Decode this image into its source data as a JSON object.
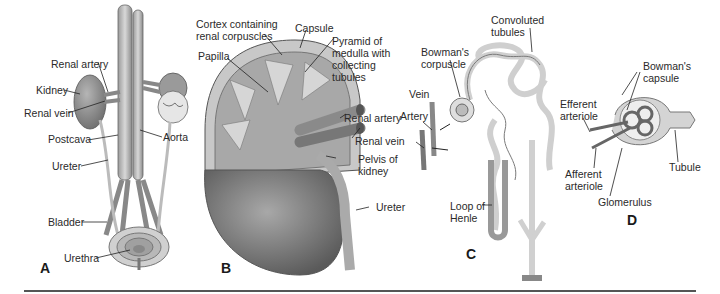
{
  "figure": {
    "panels": [
      {
        "letter": "A",
        "subject": "urinary system overview",
        "labels": [
          "Renal artery",
          "Kidney",
          "Renal vein",
          "Postcava",
          "Aorta",
          "Ureter",
          "Bladder",
          "Urethra"
        ]
      },
      {
        "letter": "B",
        "subject": "kidney section",
        "labels": [
          "Cortex containing",
          "renal corpuscles",
          "Capsule",
          "Pyramid of",
          "medulla with",
          "collecting",
          "tubules",
          "Papilla",
          "Renal artery",
          "Renal vein",
          "Pelvis of",
          "kidney",
          "Ureter"
        ]
      },
      {
        "letter": "C",
        "subject": "nephron",
        "labels": [
          "Convoluted",
          "tubules",
          "Bowman's",
          "corpuscle",
          "Vein",
          "Artery",
          "Loop of",
          "Henle"
        ]
      },
      {
        "letter": "D",
        "subject": "renal corpuscle",
        "labels": [
          "Bowman's",
          "capsule",
          "Efferent",
          "arteriole",
          "Afferent",
          "arteriole",
          "Glomerulus",
          "Tubule"
        ]
      }
    ]
  },
  "A": {
    "letter": "A",
    "renal_artery": "Renal artery",
    "kidney": "Kidney",
    "renal_vein": "Renal vein",
    "postcava": "Postcava",
    "aorta": "Aorta",
    "ureter": "Ureter",
    "bladder": "Bladder",
    "urethra": "Urethra"
  },
  "B": {
    "letter": "B",
    "cortex_1": "Cortex containing",
    "cortex_2": "renal corpuscles",
    "capsule": "Capsule",
    "pyramid_1": "Pyramid of",
    "pyramid_2": "medulla with",
    "pyramid_3": "collecting",
    "pyramid_4": "tubules",
    "papilla": "Papilla",
    "renal_artery": "Renal artery",
    "renal_vein": "Renal vein",
    "pelvis_1": "Pelvis of",
    "pelvis_2": "kidney",
    "ureter": "Ureter"
  },
  "C": {
    "letter": "C",
    "convoluted_1": "Convoluted",
    "convoluted_2": "tubules",
    "bowman_1": "Bowman's",
    "bowman_2": "corpuscle",
    "vein": "Vein",
    "artery": "Artery",
    "loop_1": "Loop of",
    "loop_2": "Henle"
  },
  "D": {
    "letter": "D",
    "bowman_1": "Bowman's",
    "bowman_2": "capsule",
    "efferent_1": "Efferent",
    "efferent_2": "arteriole",
    "afferent_1": "Afferent",
    "afferent_2": "arteriole",
    "glomerulus": "Glomerulus",
    "tubule": "Tubule"
  }
}
